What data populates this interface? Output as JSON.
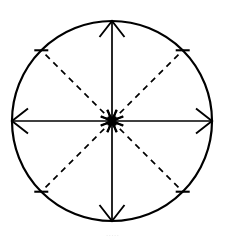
{
  "figure": {
    "background_color": "#ffffff",
    "stroke_color": "#000000",
    "canvas": {
      "width": 225,
      "height": 239
    }
  },
  "circle": {
    "name": "outer-circle",
    "center_x": 112,
    "center_y": 121,
    "radius": 100,
    "stroke_width": 2.2,
    "fill": "none",
    "style": "solid"
  },
  "axes": {
    "style": "solid",
    "stroke_width": 1.7,
    "members": [
      {
        "label": "vertical-axis",
        "orientation": "vertical",
        "x1": 112,
        "y1": 21,
        "x2": 112,
        "y2": 221
      },
      {
        "label": "horizontal-axis",
        "orientation": "horizontal",
        "x1": 12,
        "y1": 121,
        "x2": 212,
        "y2": 121
      }
    ]
  },
  "diagonals": {
    "style": "dashed",
    "stroke_width": 1.7,
    "dash_pattern": "6 5",
    "members": [
      {
        "label": "diagonal-nw",
        "angle_deg": 135,
        "x1": 112,
        "y1": 121,
        "x2": 41.3,
        "y2": 50.3
      },
      {
        "label": "diagonal-ne",
        "angle_deg": 45,
        "x1": 112,
        "y1": 121,
        "x2": 182.7,
        "y2": 50.3
      },
      {
        "label": "diagonal-sw",
        "angle_deg": 225,
        "x1": 112,
        "y1": 121,
        "x2": 41.3,
        "y2": 191.7
      },
      {
        "label": "diagonal-se",
        "angle_deg": 315,
        "x1": 112,
        "y1": 121,
        "x2": 182.7,
        "y2": 191.7
      }
    ]
  },
  "outward_arrowheads": {
    "description": "Arrowheads at circle perimeter on the solid axes, pointing away from center",
    "count": 4,
    "members": [
      {
        "label": "arrow-up",
        "direction": "up",
        "tip_x": 112,
        "tip_y": 21
      },
      {
        "label": "arrow-down",
        "direction": "down",
        "tip_x": 112,
        "tip_y": 221
      },
      {
        "label": "arrow-left",
        "direction": "left",
        "tip_x": 12,
        "tip_y": 121
      },
      {
        "label": "arrow-right",
        "direction": "right",
        "tip_x": 212,
        "tip_y": 121
      }
    ]
  },
  "edge_ticks": {
    "description": "Short perpendicular tick marks where dashed diagonals meet the circle",
    "count": 4,
    "members": [
      {
        "label": "tick-nw",
        "angle_deg": 135
      },
      {
        "label": "tick-ne",
        "angle_deg": 45
      },
      {
        "label": "tick-sw",
        "angle_deg": 225
      },
      {
        "label": "tick-se",
        "angle_deg": 315
      }
    ]
  },
  "center_arrowheads": {
    "description": "Eight arrowheads converging inward at the center point from all eight directions",
    "count": 8,
    "offset_from_center": 13,
    "head_length": 9,
    "head_half_width": 5,
    "directions": [
      "from-north",
      "from-northeast",
      "from-east",
      "from-southeast",
      "from-south",
      "from-southwest",
      "from-west",
      "from-northwest"
    ]
  },
  "bottom_artifact": {
    "text": "·····",
    "visible": true,
    "note": "faint clipped scan artifact along bottom edge"
  }
}
